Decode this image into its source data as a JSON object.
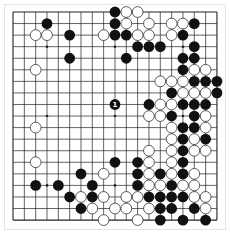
{
  "board": {
    "size": 19,
    "origin_x": 13,
    "origin_y": 12,
    "step_x": 11.33,
    "step_y": 11.56,
    "stone_radius": 5.4,
    "colors": {
      "line": "#222222",
      "black": "#111111",
      "white_fill": "#ffffff",
      "white_stroke": "#333333",
      "label_on_black": "#ffffff"
    },
    "star_points": [
      [
        3,
        3
      ],
      [
        9,
        3
      ],
      [
        15,
        3
      ],
      [
        3,
        9
      ],
      [
        9,
        9
      ],
      [
        15,
        9
      ],
      [
        3,
        15
      ],
      [
        9,
        15
      ],
      [
        15,
        15
      ]
    ],
    "stones": [
      {
        "col": 9,
        "row": 0,
        "color": "black"
      },
      {
        "col": 10,
        "row": 0,
        "color": "white"
      },
      {
        "col": 11,
        "row": 0,
        "color": "white"
      },
      {
        "col": 3,
        "row": 1,
        "color": "black"
      },
      {
        "col": 9,
        "row": 1,
        "color": "black"
      },
      {
        "col": 10,
        "row": 1,
        "color": "white"
      },
      {
        "col": 12,
        "row": 1,
        "color": "white"
      },
      {
        "col": 14,
        "row": 1,
        "color": "white"
      },
      {
        "col": 15,
        "row": 1,
        "color": "white"
      },
      {
        "col": 16,
        "row": 1,
        "color": "black"
      },
      {
        "col": 2,
        "row": 2,
        "color": "white"
      },
      {
        "col": 3,
        "row": 2,
        "color": "white"
      },
      {
        "col": 5,
        "row": 2,
        "color": "black"
      },
      {
        "col": 8,
        "row": 2,
        "color": "white"
      },
      {
        "col": 9,
        "row": 2,
        "color": "black"
      },
      {
        "col": 10,
        "row": 2,
        "color": "black"
      },
      {
        "col": 11,
        "row": 2,
        "color": "white"
      },
      {
        "col": 12,
        "row": 2,
        "color": "white"
      },
      {
        "col": 14,
        "row": 2,
        "color": "white"
      },
      {
        "col": 15,
        "row": 2,
        "color": "black"
      },
      {
        "col": 11,
        "row": 3,
        "color": "black"
      },
      {
        "col": 12,
        "row": 3,
        "color": "black"
      },
      {
        "col": 13,
        "row": 3,
        "color": "black"
      },
      {
        "col": 16,
        "row": 3,
        "color": "black"
      },
      {
        "col": 5,
        "row": 4,
        "color": "black"
      },
      {
        "col": 10,
        "row": 4,
        "color": "black"
      },
      {
        "col": 15,
        "row": 4,
        "color": "black"
      },
      {
        "col": 16,
        "row": 4,
        "color": "black"
      },
      {
        "col": 2,
        "row": 5,
        "color": "white"
      },
      {
        "col": 15,
        "row": 5,
        "color": "black"
      },
      {
        "col": 16,
        "row": 5,
        "color": "white"
      },
      {
        "col": 17,
        "row": 5,
        "color": "white"
      },
      {
        "col": 13,
        "row": 6,
        "color": "white"
      },
      {
        "col": 14,
        "row": 6,
        "color": "white"
      },
      {
        "col": 15,
        "row": 6,
        "color": "white"
      },
      {
        "col": 16,
        "row": 6,
        "color": "black"
      },
      {
        "col": 17,
        "row": 6,
        "color": "black"
      },
      {
        "col": 18,
        "row": 6,
        "color": "black"
      },
      {
        "col": 14,
        "row": 7,
        "color": "black"
      },
      {
        "col": 15,
        "row": 7,
        "color": "white"
      },
      {
        "col": 16,
        "row": 7,
        "color": "white"
      },
      {
        "col": 17,
        "row": 7,
        "color": "white"
      },
      {
        "col": 18,
        "row": 7,
        "color": "black"
      },
      {
        "col": 9,
        "row": 8,
        "color": "black",
        "label": "1"
      },
      {
        "col": 12,
        "row": 8,
        "color": "black"
      },
      {
        "col": 13,
        "row": 8,
        "color": "white"
      },
      {
        "col": 14,
        "row": 8,
        "color": "white"
      },
      {
        "col": 15,
        "row": 8,
        "color": "black"
      },
      {
        "col": 16,
        "row": 8,
        "color": "black"
      },
      {
        "col": 17,
        "row": 8,
        "color": "black"
      },
      {
        "col": 12,
        "row": 9,
        "color": "white"
      },
      {
        "col": 13,
        "row": 9,
        "color": "white"
      },
      {
        "col": 14,
        "row": 9,
        "color": "black"
      },
      {
        "col": 16,
        "row": 9,
        "color": "black"
      },
      {
        "col": 17,
        "row": 9,
        "color": "white"
      },
      {
        "col": 2,
        "row": 10,
        "color": "white"
      },
      {
        "col": 14,
        "row": 10,
        "color": "white"
      },
      {
        "col": 15,
        "row": 10,
        "color": "black"
      },
      {
        "col": 16,
        "row": 10,
        "color": "black"
      },
      {
        "col": 17,
        "row": 10,
        "color": "white"
      },
      {
        "col": 14,
        "row": 11,
        "color": "white"
      },
      {
        "col": 15,
        "row": 11,
        "color": "black"
      },
      {
        "col": 16,
        "row": 11,
        "color": "white"
      },
      {
        "col": 17,
        "row": 11,
        "color": "black"
      },
      {
        "col": 12,
        "row": 12,
        "color": "white"
      },
      {
        "col": 14,
        "row": 12,
        "color": "white"
      },
      {
        "col": 15,
        "row": 12,
        "color": "black"
      },
      {
        "col": 16,
        "row": 12,
        "color": "white"
      },
      {
        "col": 17,
        "row": 12,
        "color": "white"
      },
      {
        "col": 2,
        "row": 13,
        "color": "white"
      },
      {
        "col": 9,
        "row": 13,
        "color": "black"
      },
      {
        "col": 11,
        "row": 13,
        "color": "black"
      },
      {
        "col": 12,
        "row": 13,
        "color": "white"
      },
      {
        "col": 14,
        "row": 13,
        "color": "white"
      },
      {
        "col": 15,
        "row": 13,
        "color": "black"
      },
      {
        "col": 6,
        "row": 14,
        "color": "black"
      },
      {
        "col": 8,
        "row": 14,
        "color": "white"
      },
      {
        "col": 11,
        "row": 14,
        "color": "black"
      },
      {
        "col": 12,
        "row": 14,
        "color": "white"
      },
      {
        "col": 13,
        "row": 14,
        "color": "black"
      },
      {
        "col": 14,
        "row": 14,
        "color": "white"
      },
      {
        "col": 15,
        "row": 14,
        "color": "black"
      },
      {
        "col": 16,
        "row": 14,
        "color": "white"
      },
      {
        "col": 2,
        "row": 15,
        "color": "black"
      },
      {
        "col": 4,
        "row": 15,
        "color": "black"
      },
      {
        "col": 7,
        "row": 15,
        "color": "black"
      },
      {
        "col": 11,
        "row": 15,
        "color": "black"
      },
      {
        "col": 12,
        "row": 15,
        "color": "white"
      },
      {
        "col": 13,
        "row": 15,
        "color": "white"
      },
      {
        "col": 14,
        "row": 15,
        "color": "black"
      },
      {
        "col": 15,
        "row": 15,
        "color": "white"
      },
      {
        "col": 16,
        "row": 15,
        "color": "white"
      },
      {
        "col": 5,
        "row": 16,
        "color": "black"
      },
      {
        "col": 6,
        "row": 16,
        "color": "white"
      },
      {
        "col": 7,
        "row": 16,
        "color": "black"
      },
      {
        "col": 8,
        "row": 16,
        "color": "white"
      },
      {
        "col": 10,
        "row": 16,
        "color": "white"
      },
      {
        "col": 11,
        "row": 16,
        "color": "white"
      },
      {
        "col": 12,
        "row": 16,
        "color": "black"
      },
      {
        "col": 13,
        "row": 16,
        "color": "black"
      },
      {
        "col": 14,
        "row": 16,
        "color": "black"
      },
      {
        "col": 15,
        "row": 16,
        "color": "black"
      },
      {
        "col": 16,
        "row": 16,
        "color": "white"
      },
      {
        "col": 17,
        "row": 16,
        "color": "white"
      },
      {
        "col": 6,
        "row": 17,
        "color": "black"
      },
      {
        "col": 7,
        "row": 17,
        "color": "white"
      },
      {
        "col": 9,
        "row": 17,
        "color": "white"
      },
      {
        "col": 10,
        "row": 17,
        "color": "white"
      },
      {
        "col": 12,
        "row": 17,
        "color": "white"
      },
      {
        "col": 13,
        "row": 17,
        "color": "black"
      },
      {
        "col": 14,
        "row": 17,
        "color": "black"
      },
      {
        "col": 16,
        "row": 17,
        "color": "black"
      },
      {
        "col": 17,
        "row": 17,
        "color": "white"
      },
      {
        "col": 8,
        "row": 18,
        "color": "white"
      },
      {
        "col": 11,
        "row": 18,
        "color": "white"
      },
      {
        "col": 13,
        "row": 18,
        "color": "black"
      },
      {
        "col": 15,
        "row": 18,
        "color": "black"
      },
      {
        "col": 17,
        "row": 18,
        "color": "black"
      }
    ]
  }
}
